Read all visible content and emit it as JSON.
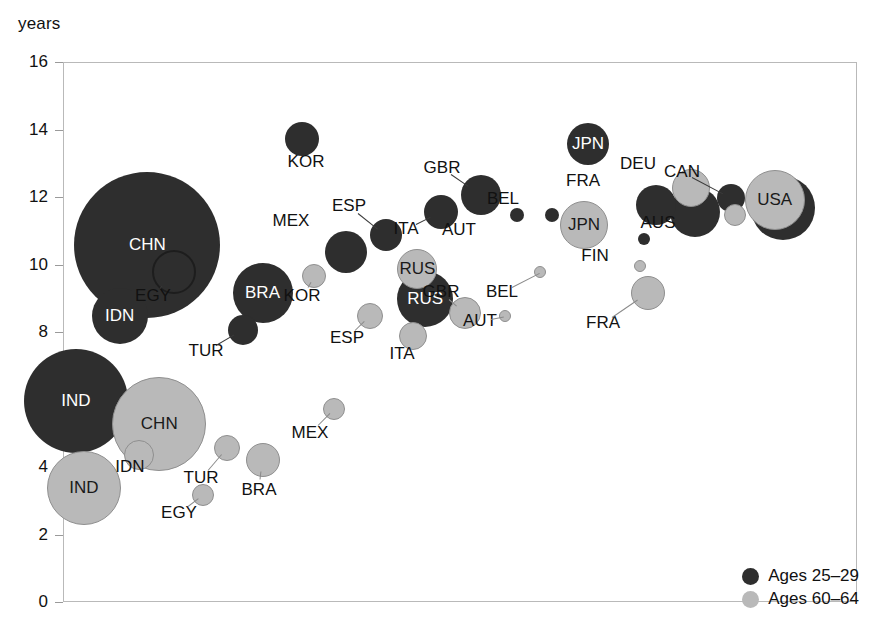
{
  "axis_unit_label": "years",
  "legend": {
    "items": [
      {
        "key": "young",
        "label": "Ages 25–29",
        "color": "#2e2e2e"
      },
      {
        "key": "old",
        "label": "Ages 60–64",
        "color": "#b9b9b9"
      }
    ]
  },
  "chart_data": {
    "type": "scatter",
    "title": "",
    "xlabel": "",
    "ylabel": "years",
    "ylim": [
      0,
      16
    ],
    "yticks": [
      0,
      2,
      4,
      6,
      8,
      10,
      12,
      14,
      16
    ],
    "xlim": [
      0,
      100
    ],
    "grid": false,
    "legend_position": "bottom-right",
    "note": "Bubble chart; bubble area encodes population size. Dark = Ages 25-29, light grey = Ages 60-64. X axis unlabelled (countries ordered left to right).",
    "series": [
      {
        "name": "Ages 25–29",
        "color": "#2e2e2e",
        "points": [
          {
            "code": "IND",
            "x": 1.5,
            "y": 6.0,
            "r": 52,
            "label_pos": "inside"
          },
          {
            "code": "CHN",
            "x": 10.5,
            "y": 10.6,
            "r": 73,
            "label_pos": "inside"
          },
          {
            "code": "IDN",
            "x": 7.0,
            "y": 8.5,
            "r": 28,
            "label_pos": "inside"
          },
          {
            "code": "EGY",
            "x": 13.8,
            "y": 9.8,
            "r": 22,
            "label_pos": "leader-below"
          },
          {
            "code": "BRA",
            "x": 25.0,
            "y": 9.2,
            "r": 30,
            "label_pos": "inside"
          },
          {
            "code": "TUR",
            "x": 22.5,
            "y": 8.1,
            "r": 15,
            "label_pos": "leader-below"
          },
          {
            "code": "KOR",
            "x": 30.0,
            "y": 13.75,
            "r": 17,
            "label_pos": "leader-below"
          },
          {
            "code": "MEX",
            "x": 35.5,
            "y": 10.4,
            "r": 21,
            "label_pos": "leader-upleft"
          },
          {
            "code": "ESP",
            "x": 40.5,
            "y": 10.9,
            "r": 16,
            "label_pos": "leader-up"
          },
          {
            "code": "ITA",
            "x": 47.5,
            "y": 11.6,
            "r": 17,
            "label_pos": "leader-below"
          },
          {
            "code": "GBR",
            "x": 52.5,
            "y": 12.1,
            "r": 20,
            "label_pos": "leader-up"
          },
          {
            "code": "AUT",
            "x": 57.0,
            "y": 11.5,
            "r": 7,
            "label_pos": "leader-below"
          },
          {
            "code": "BEL",
            "x": 61.5,
            "y": 11.5,
            "r": 7,
            "label_pos": "leader-up"
          },
          {
            "code": "RUS",
            "x": 45.5,
            "y": 9.0,
            "r": 28,
            "label_pos": "inside"
          },
          {
            "code": "JPN",
            "x": 66.0,
            "y": 13.6,
            "r": 21,
            "label_pos": "inside"
          },
          {
            "code": "FIN",
            "x": 73.0,
            "y": 10.8,
            "r": 6,
            "label_pos": "leader-right"
          },
          {
            "code": "FRA",
            "x": 74.5,
            "y": 11.8,
            "r": 20,
            "label_pos": "leader-up"
          },
          {
            "code": "DEU",
            "x": 79.5,
            "y": 11.6,
            "r": 25,
            "label_pos": "leader-up"
          },
          {
            "code": "CAN",
            "x": 84.0,
            "y": 12.0,
            "r": 14,
            "label_pos": "leader-up"
          },
          {
            "code": "USA",
            "x": 90.5,
            "y": 11.7,
            "r": 32,
            "label_pos": "inside"
          }
        ]
      },
      {
        "name": "Ages 60–64",
        "color": "#b9b9b9",
        "points": [
          {
            "code": "IND",
            "x": 2.5,
            "y": 3.4,
            "r": 37,
            "label_pos": "inside"
          },
          {
            "code": "CHN",
            "x": 12.0,
            "y": 5.3,
            "r": 47,
            "label_pos": "inside"
          },
          {
            "code": "IDN",
            "x": 9.5,
            "y": 4.4,
            "r": 15,
            "label_pos": "leader-below"
          },
          {
            "code": "EGY",
            "x": 17.5,
            "y": 3.2,
            "r": 11,
            "label_pos": "leader-below"
          },
          {
            "code": "TUR",
            "x": 20.5,
            "y": 4.6,
            "r": 13,
            "label_pos": "leader-below"
          },
          {
            "code": "BRA",
            "x": 25.0,
            "y": 4.25,
            "r": 17,
            "label_pos": "leader-below"
          },
          {
            "code": "KOR",
            "x": 31.5,
            "y": 9.7,
            "r": 12,
            "label_pos": "leader-below"
          },
          {
            "code": "MEX",
            "x": 34.0,
            "y": 5.75,
            "r": 11,
            "label_pos": "leader-below"
          },
          {
            "code": "ESP",
            "x": 38.5,
            "y": 8.5,
            "r": 13,
            "label_pos": "leader-below"
          },
          {
            "code": "ITA",
            "x": 44.0,
            "y": 7.9,
            "r": 14,
            "label_pos": "leader-below"
          },
          {
            "code": "GBR",
            "x": 50.5,
            "y": 8.6,
            "r": 16,
            "label_pos": "leader-up"
          },
          {
            "code": "AUT",
            "x": 55.5,
            "y": 8.5,
            "r": 6,
            "label_pos": "leader-below"
          },
          {
            "code": "BEL",
            "x": 60.0,
            "y": 9.8,
            "r": 6,
            "label_pos": "leader-below"
          },
          {
            "code": "RUS",
            "x": 44.5,
            "y": 9.9,
            "r": 20,
            "label_pos": "inside"
          },
          {
            "code": "JPN",
            "x": 65.5,
            "y": 11.2,
            "r": 24,
            "label_pos": "inside"
          },
          {
            "code": "FIN",
            "x": 72.5,
            "y": 10.0,
            "r": 6,
            "label_pos": "leader-upright"
          },
          {
            "code": "FRA",
            "x": 73.5,
            "y": 9.2,
            "r": 17,
            "label_pos": "leader-below"
          },
          {
            "code": "DEU",
            "x": 79.0,
            "y": 12.3,
            "r": 19,
            "label_pos": "leader-up"
          },
          {
            "code": "AUS",
            "x": 84.5,
            "y": 11.5,
            "r": 11,
            "label_pos": "leader-below"
          },
          {
            "code": "USA",
            "x": 89.5,
            "y": 11.95,
            "r": 30,
            "label_pos": "inside"
          }
        ]
      }
    ],
    "outside_labels": [
      {
        "text": "EGY",
        "x": 152,
        "y": 295,
        "series": "young"
      },
      {
        "text": "TUR",
        "x": 205,
        "y": 350,
        "series": "young"
      },
      {
        "text": "KOR",
        "x": 305,
        "y": 161,
        "series": "young"
      },
      {
        "text": "MEX",
        "x": 290,
        "y": 220,
        "series": "young"
      },
      {
        "text": "ESP",
        "x": 348,
        "y": 205,
        "series": "young"
      },
      {
        "text": "ITA",
        "x": 405,
        "y": 228,
        "series": "young"
      },
      {
        "text": "GBR",
        "x": 441,
        "y": 167,
        "series": "young"
      },
      {
        "text": "AUT",
        "x": 458,
        "y": 229,
        "series": "young"
      },
      {
        "text": "BEL",
        "x": 502,
        "y": 198,
        "series": "young"
      },
      {
        "text": "FRA",
        "x": 582,
        "y": 180,
        "series": "young"
      },
      {
        "text": "DEU",
        "x": 637,
        "y": 163,
        "series": "young"
      },
      {
        "text": "CAN",
        "x": 681,
        "y": 171,
        "series": "young"
      },
      {
        "text": "FIN",
        "x": 594,
        "y": 255,
        "series": "young"
      },
      {
        "text": "IDN",
        "x": 129,
        "y": 466,
        "series": "old"
      },
      {
        "text": "EGY",
        "x": 178,
        "y": 512,
        "series": "old"
      },
      {
        "text": "TUR",
        "x": 200,
        "y": 477,
        "series": "old"
      },
      {
        "text": "BRA",
        "x": 258,
        "y": 489,
        "series": "old"
      },
      {
        "text": "KOR",
        "x": 301,
        "y": 295,
        "series": "old"
      },
      {
        "text": "MEX",
        "x": 309,
        "y": 432,
        "series": "old"
      },
      {
        "text": "ESP",
        "x": 346,
        "y": 337,
        "series": "old"
      },
      {
        "text": "ITA",
        "x": 401,
        "y": 353,
        "series": "old"
      },
      {
        "text": "GBR",
        "x": 440,
        "y": 291,
        "series": "old"
      },
      {
        "text": "AUT",
        "x": 479,
        "y": 320,
        "series": "old"
      },
      {
        "text": "BEL",
        "x": 501,
        "y": 291,
        "series": "old"
      },
      {
        "text": "FRA",
        "x": 602,
        "y": 322,
        "series": "old"
      },
      {
        "text": "AUS",
        "x": 657,
        "y": 222,
        "series": "old"
      }
    ]
  }
}
